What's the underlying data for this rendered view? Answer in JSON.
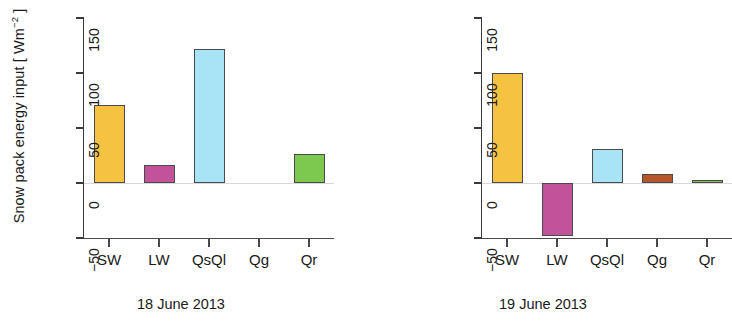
{
  "figure": {
    "ylabel_main": "Snow pack energy input [ Wm",
    "ylabel_exp": "−2",
    "ylabel_tail": " ]"
  },
  "chart_data": [
    {
      "type": "bar",
      "title": "18 June 2013",
      "categories": [
        "SW",
        "LW",
        "QsQl",
        "Qg",
        "Qr"
      ],
      "values": [
        71,
        16,
        122,
        0,
        26
      ],
      "colors": [
        "#F5C242",
        "#C1539A",
        "#A8E4F5",
        "#B5562B",
        "#7DC94F"
      ],
      "xlabel": "",
      "ylabel": "Snow pack energy input [ Wm-2 ]",
      "ylim": [
        -50,
        150
      ],
      "yticks": [
        -50,
        0,
        50,
        100,
        150
      ],
      "yticklabels": [
        "−50",
        "0",
        "50",
        "100",
        "150"
      ],
      "grid": false,
      "legend": "none"
    },
    {
      "type": "bar",
      "title": "19 June 2013",
      "categories": [
        "SW",
        "LW",
        "QsQl",
        "Qg",
        "Qr"
      ],
      "values": [
        100,
        -48,
        31,
        8,
        3
      ],
      "colors": [
        "#F5C242",
        "#C1539A",
        "#A8E4F5",
        "#B5562B",
        "#7DC94F"
      ],
      "xlabel": "",
      "ylabel": "",
      "ylim": [
        -50,
        150
      ],
      "yticks": [
        -50,
        0,
        50,
        100,
        150
      ],
      "yticklabels": [
        "−50",
        "0",
        "50",
        "100",
        "150"
      ],
      "grid": false,
      "legend": "none"
    }
  ]
}
